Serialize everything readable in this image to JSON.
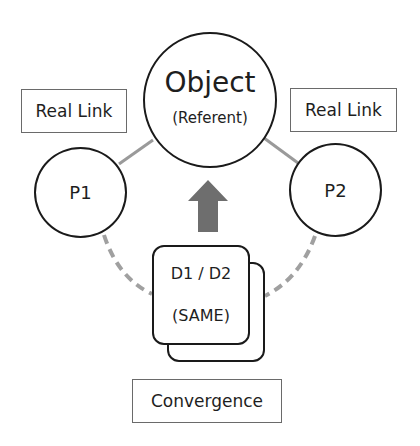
{
  "diagram": {
    "object": {
      "title": "Object",
      "subtitle": "(Referent)"
    },
    "participants": [
      {
        "id": "p1",
        "label": "P1",
        "link_label": "Real Link"
      },
      {
        "id": "p2",
        "label": "P2",
        "link_label": "Real Link"
      }
    ],
    "shared_card": {
      "line1": "D1 / D2",
      "line2": "(SAME)"
    },
    "caption": "Convergence",
    "arrow": {
      "direction": "up",
      "color": "#6e6e6e"
    },
    "colors": {
      "stroke": "#1a1a1a",
      "solid_link": "#9a9a9a",
      "dashed_link": "#a0a0a0",
      "box_border": "#6a6a6a",
      "background": "#ffffff"
    }
  }
}
